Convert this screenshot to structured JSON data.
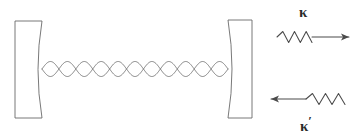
{
  "figure": {
    "kind": "optical-cavity-diagram",
    "background_color": "#ffffff",
    "stroke_color": "#666666",
    "label_color": "#2b2b2b",
    "width": 358,
    "height": 140
  },
  "cavity": {
    "left_mirror": {
      "name": "left-curved-mirror",
      "x": 15,
      "y": 21,
      "width": 27,
      "height": 97,
      "curvature": "concave-right-face",
      "bulge": 8
    },
    "right_mirror": {
      "name": "right-curved-mirror",
      "x": 228,
      "y": 20,
      "width": 24,
      "height": 98,
      "curvature": "concave-left-face",
      "bulge": 8
    },
    "standing_wave": {
      "name": "standing-wave-mode",
      "x_start": 42,
      "x_end": 228,
      "center_y": 69,
      "amplitude": 7.5,
      "lobes": 11
    }
  },
  "couplings": [
    {
      "id": "kappa-out",
      "label": "κ",
      "label_has_prime": false,
      "direction": "right",
      "arrow_y": 37,
      "squiggle_x_start": 277,
      "squiggle_x_end": 312,
      "line_x_end": 349,
      "zigzag_peaks": 3,
      "description": "outgoing photon decay rate"
    },
    {
      "id": "kappa-prime-in",
      "label": "κ",
      "label_has_prime": true,
      "direction": "left",
      "arrow_y": 99,
      "squiggle_x_start": 306,
      "squiggle_x_end": 345,
      "line_x_end": 271,
      "zigzag_peaks": 3,
      "description": "incoming drive coupling rate"
    }
  ],
  "labels": {
    "kappa": "κ",
    "kappa_prime_base": "κ",
    "kappa_prime_mark": "′"
  }
}
